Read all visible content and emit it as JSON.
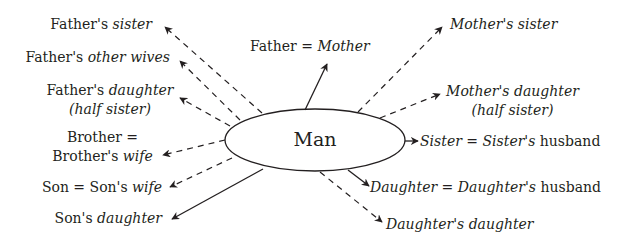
{
  "center": {
    "label": "Man"
  },
  "labels": {
    "fathers_sister": {
      "a": "Father's ",
      "b": "sister"
    },
    "fathers_other_wives": {
      "a": "Father's ",
      "b": "other wives"
    },
    "fathers_daughter": {
      "a": "Father's ",
      "b": "daughter",
      "line2": "(half sister)"
    },
    "brother": {
      "line1": "Brother =",
      "a": "Brother's ",
      "b": "wife"
    },
    "son": {
      "a": "Son = Son's ",
      "b": "wife"
    },
    "sons_daughter": {
      "a": "Son's ",
      "b": "daughter"
    },
    "father": {
      "a": "Father = ",
      "b": "Mother"
    },
    "mothers_sister": {
      "a": "Mother's sister"
    },
    "mothers_daughter": {
      "a": "Mother's daughter",
      "line2": "(half sister)"
    },
    "sister": {
      "a": "Sister",
      "b": " = ",
      "c": "Sister's",
      "d": " husband"
    },
    "daughter": {
      "a": "Daughter",
      "b": " = ",
      "c": "Daughter's",
      "d": " husband"
    },
    "daughters_daughter": {
      "a": "Daughter's daughter"
    }
  },
  "colors": {
    "ink": "#231f20",
    "background": "#ffffff"
  }
}
